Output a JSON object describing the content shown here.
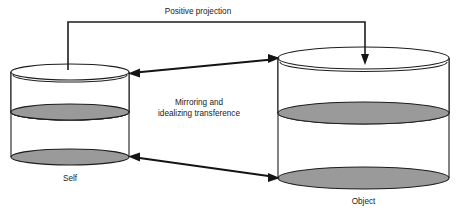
{
  "diagram": {
    "title_label": "Positive projection",
    "middle_label_line1": "Mirroring and",
    "middle_label_line2": "idealizing transference",
    "self_label": "Self",
    "object_label": "Object",
    "colors": {
      "stroke": "#1d1d1d",
      "shaded_fill": "#9a9a9a",
      "body_fill": "#ffffff",
      "background": "#ffffff",
      "arrow": "#141414"
    },
    "nodes": [
      {
        "id": "self",
        "label": "Self",
        "kind": "cylinder",
        "x_left": 11,
        "x_right": 129,
        "top_ellipse_cy": 72,
        "middle_ellipse_cy": 112,
        "bottom_ellipse_cy": 157,
        "ellipse_ry": 8,
        "shaded_bands": 2
      },
      {
        "id": "object",
        "label": "Object",
        "kind": "cylinder",
        "x_left": 278,
        "x_right": 449,
        "top_ellipse_cy": 58,
        "middle_ellipse_cy": 113,
        "bottom_ellipse_cy": 178,
        "ellipse_ry": 11,
        "shaded_bands": 2
      }
    ],
    "connectors": [
      {
        "id": "positive-projection",
        "label": "Positive projection",
        "from": "self",
        "to": "object",
        "style": "bracket",
        "arrowheads": "end"
      },
      {
        "id": "upper-transference",
        "label": "Mirroring and idealizing transference",
        "from": "self",
        "to": "object",
        "style": "straight",
        "arrowheads": "both"
      },
      {
        "id": "lower-transference",
        "label": "",
        "from": "object",
        "to": "self",
        "style": "straight",
        "arrowheads": "both"
      }
    ]
  }
}
